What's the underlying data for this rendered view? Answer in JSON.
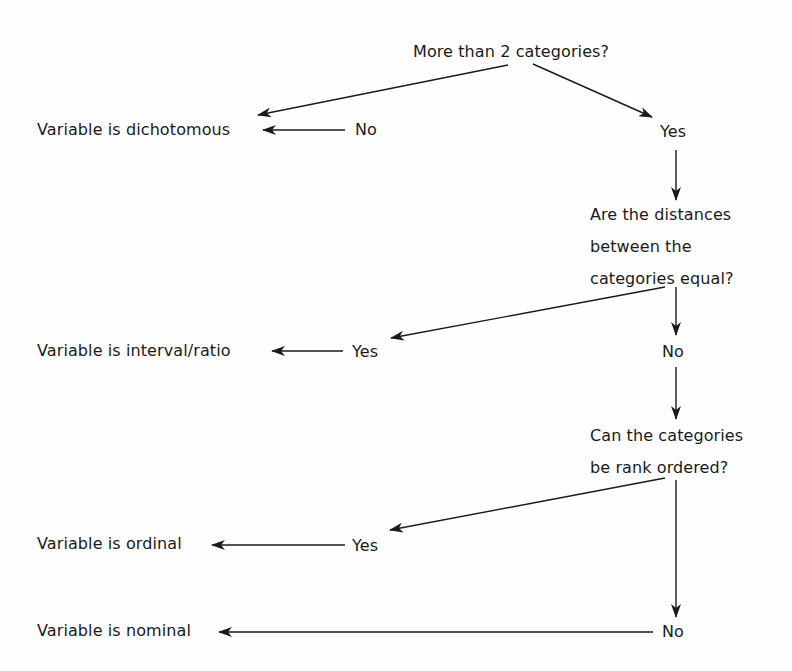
{
  "diagram": {
    "type": "decision-flowchart",
    "nodes": {
      "q1": {
        "text": "More than 2 categories?"
      },
      "q1_no": {
        "text": "No"
      },
      "q1_yes": {
        "text": "Yes"
      },
      "r_dichotomous": {
        "text": "Variable is dichotomous"
      },
      "q2": {
        "lines": [
          "Are the distances",
          "between the",
          "categories equal?"
        ]
      },
      "q2_yes": {
        "text": "Yes"
      },
      "q2_no": {
        "text": "No"
      },
      "r_interval": {
        "text": "Variable is interval/ratio"
      },
      "q3": {
        "lines": [
          "Can the categories",
          "be rank ordered?"
        ]
      },
      "q3_yes": {
        "text": "Yes"
      },
      "q3_no": {
        "text": "No"
      },
      "r_ordinal": {
        "text": "Variable is ordinal"
      },
      "r_nominal": {
        "text": "Variable is nominal"
      }
    },
    "edges": [
      {
        "from": "q1",
        "to": "q1_no"
      },
      {
        "from": "q1",
        "to": "q1_yes"
      },
      {
        "from": "q1_no",
        "to": "r_dichotomous"
      },
      {
        "from": "q1_yes",
        "to": "q2"
      },
      {
        "from": "q2",
        "to": "q2_yes"
      },
      {
        "from": "q2",
        "to": "q2_no"
      },
      {
        "from": "q2_yes",
        "to": "r_interval"
      },
      {
        "from": "q2_no",
        "to": "q3"
      },
      {
        "from": "q3",
        "to": "q3_yes"
      },
      {
        "from": "q3",
        "to": "q3_no"
      },
      {
        "from": "q3_yes",
        "to": "r_ordinal"
      },
      {
        "from": "q3_no",
        "to": "r_nominal"
      }
    ],
    "colors": {
      "ink": "#1a1a1a",
      "background": "#fefefe"
    }
  }
}
